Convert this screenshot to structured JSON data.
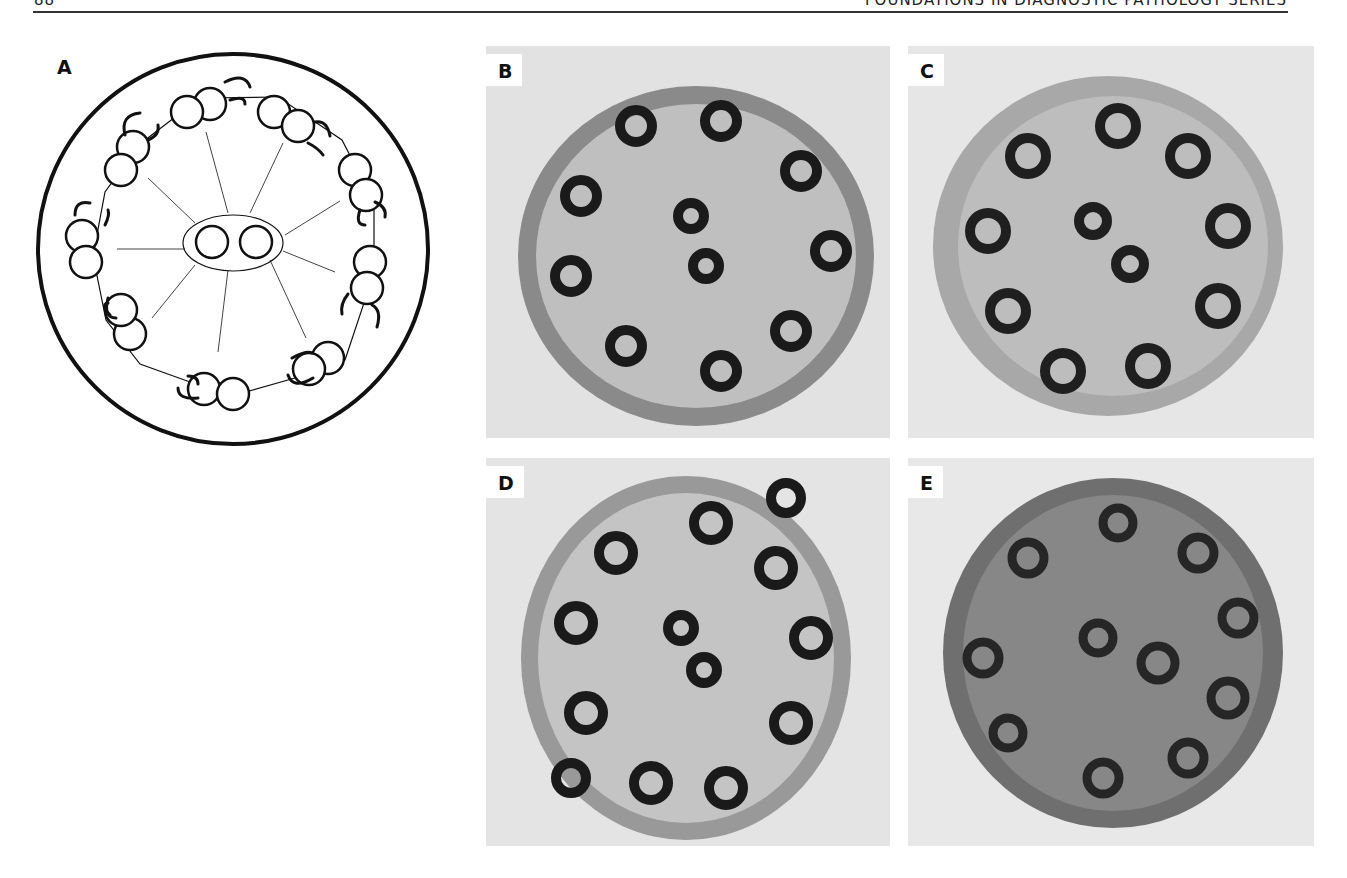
{
  "page": {
    "page_number": "88",
    "running_header": "FOUNDATIONS IN DIAGNOSTIC PATHOLOGY SERIES"
  },
  "figure": {
    "panels": [
      {
        "id": "A",
        "label": "A",
        "type": "schematic diagram",
        "description": "Axoneme cross-section: 9 peripheral microtubule doublets with dynein arms, radial spokes, central pair in sheath"
      },
      {
        "id": "B",
        "label": "B",
        "type": "electron micrograph",
        "description": "Cilium cross-section with 9+2 arrangement"
      },
      {
        "id": "C",
        "label": "C",
        "type": "electron micrograph",
        "description": "Cilium cross-section with 9+2 arrangement, arms absent"
      },
      {
        "id": "D",
        "label": "D",
        "type": "electron micrograph",
        "description": "Cilium cross-section with peripheral doublets and central pair"
      },
      {
        "id": "E",
        "label": "E",
        "type": "electron micrograph",
        "description": "Cilium cross-section, dense matrix, doublets and central pair"
      }
    ]
  }
}
